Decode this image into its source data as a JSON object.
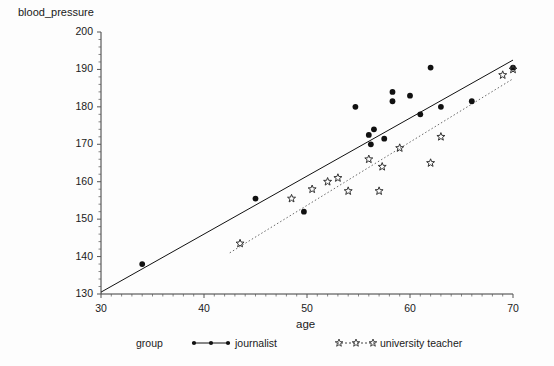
{
  "chart_data": {
    "type": "scatter",
    "title": "",
    "xlabel": "age",
    "ylabel": "blood_pressure",
    "xlim": [
      30,
      70
    ],
    "ylim": [
      130,
      200
    ],
    "xticks": [
      30,
      40,
      50,
      60,
      70
    ],
    "yticks": [
      130,
      140,
      150,
      160,
      170,
      180,
      190,
      200
    ],
    "grid": false,
    "legend_position": "bottom",
    "legend_title": "group",
    "series": [
      {
        "name": "journalist",
        "marker": "filled-circle",
        "color": "#111111",
        "line_style": "solid",
        "points": [
          {
            "x": 34.0,
            "y": 138.0
          },
          {
            "x": 45.0,
            "y": 155.5
          },
          {
            "x": 49.7,
            "y": 152.0
          },
          {
            "x": 54.7,
            "y": 180.0
          },
          {
            "x": 56.0,
            "y": 172.5
          },
          {
            "x": 56.2,
            "y": 170.0
          },
          {
            "x": 56.5,
            "y": 174.0
          },
          {
            "x": 57.5,
            "y": 171.5
          },
          {
            "x": 58.3,
            "y": 184.0
          },
          {
            "x": 58.3,
            "y": 181.5
          },
          {
            "x": 60.0,
            "y": 183.0
          },
          {
            "x": 61.0,
            "y": 178.0
          },
          {
            "x": 62.0,
            "y": 190.5
          },
          {
            "x": 63.0,
            "y": 180.0
          },
          {
            "x": 66.0,
            "y": 181.5
          },
          {
            "x": 70.0,
            "y": 190.5
          }
        ],
        "fit_line": {
          "x0": 30.0,
          "y0": 130.5,
          "x1": 70.0,
          "y1": 192.5
        }
      },
      {
        "name": "university teacher",
        "marker": "star",
        "color": "#333333",
        "line_style": "dotted",
        "points": [
          {
            "x": 43.5,
            "y": 143.5
          },
          {
            "x": 48.5,
            "y": 155.5
          },
          {
            "x": 50.5,
            "y": 158.0
          },
          {
            "x": 52.0,
            "y": 160.0
          },
          {
            "x": 53.0,
            "y": 161.0
          },
          {
            "x": 54.0,
            "y": 157.5
          },
          {
            "x": 56.0,
            "y": 166.0
          },
          {
            "x": 57.0,
            "y": 157.5
          },
          {
            "x": 57.3,
            "y": 164.0
          },
          {
            "x": 59.0,
            "y": 169.0
          },
          {
            "x": 62.0,
            "y": 165.0
          },
          {
            "x": 63.0,
            "y": 172.0
          },
          {
            "x": 69.0,
            "y": 188.5
          },
          {
            "x": 70.0,
            "y": 190.0
          }
        ],
        "fit_line": {
          "x0": 42.5,
          "y0": 141.0,
          "x1": 70.0,
          "y1": 187.5
        }
      }
    ]
  },
  "axes": {
    "y_title": "blood_pressure",
    "x_title": "age",
    "y_tick_labels": [
      "200",
      "190",
      "180",
      "170",
      "160",
      "150",
      "140",
      "130"
    ],
    "x_tick_labels": [
      "30",
      "40",
      "50",
      "60",
      "70"
    ]
  },
  "legend": {
    "title": "group",
    "journalist_label": "journalist",
    "teacher_label": "university teacher"
  }
}
